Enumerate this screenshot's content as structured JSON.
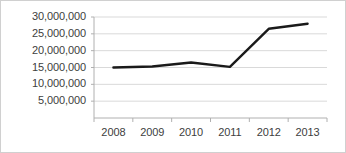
{
  "chart_data": {
    "type": "line",
    "title": "",
    "subtitle": "",
    "xlabel": "",
    "ylabel": "",
    "categories": [
      "2008",
      "2009",
      "2010",
      "2011",
      "2012",
      "2013"
    ],
    "series": [
      {
        "name": "",
        "values": [
          15000000,
          15300000,
          16500000,
          15200000,
          26500000,
          28000000
        ],
        "color": "#1a1a1a",
        "line_width": 2.4,
        "markers": false
      }
    ],
    "ylim": [
      0,
      30000000
    ],
    "xlim": [
      "2008",
      "2013"
    ],
    "ytick_values": [
      5000000,
      10000000,
      15000000,
      20000000,
      25000000,
      30000000
    ],
    "ytick_labels": [
      "5,000,000",
      "10,000,000",
      "15,000,000",
      "20,000,000",
      "25,000,000",
      "30,000,000"
    ],
    "xtick_labels": [
      "2008",
      "2009",
      "2010",
      "2011",
      "2012",
      "2013"
    ],
    "grid": {
      "horizontal": true,
      "vertical": false,
      "color": "#d9d9d9"
    },
    "legend": {
      "visible": false,
      "position": "none",
      "entries": []
    },
    "axis": {
      "left_spine_color": "#b0b0b0",
      "bottom_spine_color": "#b0b0b0",
      "tick_mark_color": "#b0b0b0"
    },
    "plot_background": "#ffffff",
    "figure_background": "#ffffff",
    "border_color": "#d0d0d0"
  }
}
